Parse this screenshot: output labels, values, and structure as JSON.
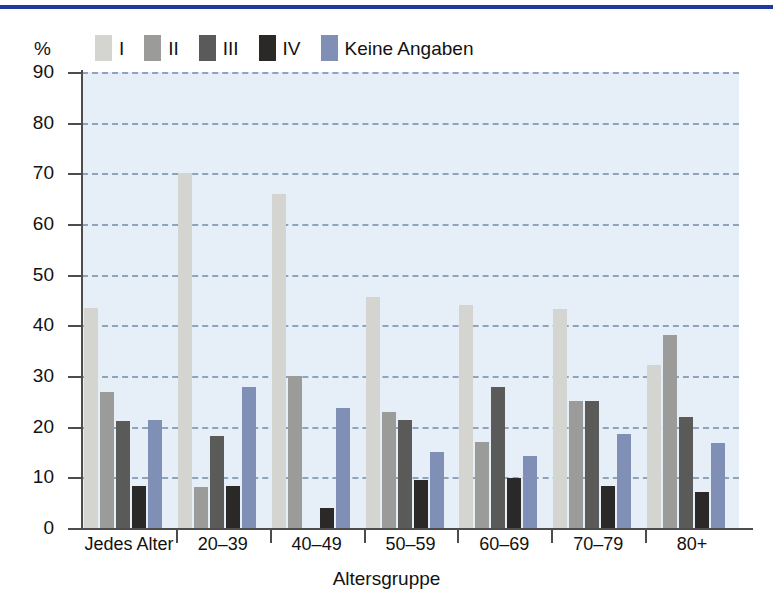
{
  "chart_data": {
    "type": "bar",
    "title": "",
    "subtitle": "",
    "xlabel": "Altersgruppe",
    "ylabel": "%",
    "ylim": [
      0,
      90
    ],
    "yticks": [
      0,
      10,
      20,
      30,
      40,
      50,
      60,
      70,
      80,
      90
    ],
    "ytick_labels": [
      "0",
      "10",
      "20",
      "30",
      "40",
      "50",
      "60",
      "70",
      "80",
      "90"
    ],
    "grid": true,
    "grid_style": "dashed-horizontal",
    "legend_position": "top-left",
    "categories": [
      "Jedes Alter",
      "20–39",
      "40–49",
      "50–59",
      "60–69",
      "70–79",
      "80+"
    ],
    "series": [
      {
        "name": "I",
        "color": "#d4d4d1",
        "values": [
          43.4,
          70.0,
          66.0,
          45.5,
          44.0,
          43.2,
          32.2
        ]
      },
      {
        "name": "II",
        "color": "#9b9b99",
        "values": [
          26.8,
          8.0,
          30.1,
          22.8,
          17.0,
          25.0,
          38.1
        ]
      },
      {
        "name": "III",
        "color": "#5a5a59",
        "values": [
          21.2,
          18.1,
          0.0,
          21.3,
          27.8,
          25.0,
          21.9
        ]
      },
      {
        "name": "IV",
        "color": "#2b2928",
        "values": [
          8.3,
          8.3,
          4.0,
          9.4,
          9.8,
          8.3,
          7.2
        ]
      },
      {
        "name": "Keine Angaben",
        "color": "#7f8fb5",
        "values": [
          21.3,
          27.8,
          23.7,
          15.1,
          14.3,
          18.5,
          16.8
        ]
      }
    ]
  },
  "legend": {
    "unit_label": "%",
    "items": [
      {
        "label": "I",
        "color": "#d4d4d1"
      },
      {
        "label": "II",
        "color": "#9b9b99"
      },
      {
        "label": "III",
        "color": "#5a5a59"
      },
      {
        "label": "IV",
        "color": "#2b2928"
      },
      {
        "label": "Keine Angaben",
        "color": "#7f8fb5"
      }
    ]
  },
  "style": {
    "plot_background": "#e6eff7",
    "grid_color": "#8ea4bd",
    "axis_color": "#4c4c4c",
    "rule_color": "#22389e",
    "text_color": "#121212"
  }
}
